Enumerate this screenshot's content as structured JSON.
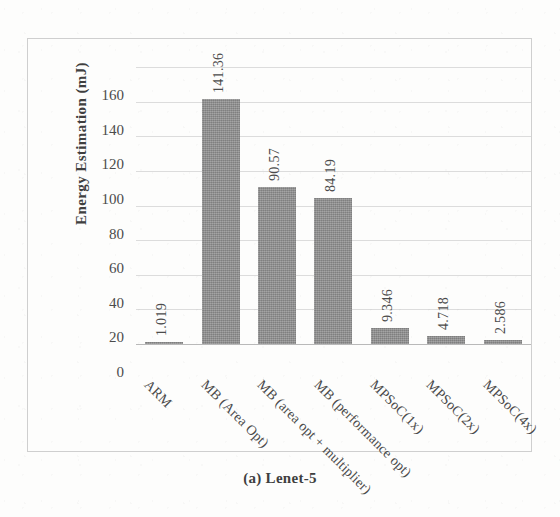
{
  "caption": "(a) Lenet-5",
  "colors": {
    "bar_fill": "#8b8b8b",
    "gridline": "#dcdcdc",
    "axis": "#b9b9b9",
    "text": "#4b4b4b",
    "page_background": "#fdfdfc"
  },
  "chart_data": {
    "type": "bar",
    "title": "(a) Lenet-5",
    "xlabel": "",
    "ylabel": "Energy Estimation (mJ)",
    "ylim": [
      0,
      160
    ],
    "ytick_step": 20,
    "yticks": [
      160,
      140,
      120,
      100,
      80,
      60,
      40,
      20,
      0
    ],
    "ytick_labels": [
      "160",
      "140",
      "120",
      "100",
      "80",
      "60",
      "40",
      "20",
      "0"
    ],
    "grid": true,
    "legend": false,
    "categories": [
      "ARM",
      "MB (Area Opt)",
      "MB (area opt + multiplier)",
      "MB (performance opt)",
      "MPSoC(1x)",
      "MPSoC(2x)",
      "MPSoC(4x)"
    ],
    "values": [
      1.019,
      141.36,
      90.57,
      84.19,
      9.346,
      4.718,
      2.586
    ],
    "data_labels": [
      "1.019",
      "141.36",
      "90.57",
      "84.19",
      "9.346",
      "4.718",
      "2.586"
    ],
    "bars": [
      {
        "category": "ARM",
        "value": 1.019,
        "label": "1.019"
      },
      {
        "category": "MB (Area Opt)",
        "value": 141.36,
        "label": "141.36"
      },
      {
        "category": "MB (area opt + multiplier)",
        "value": 90.57,
        "label": "90.57"
      },
      {
        "category": "MB (performance opt)",
        "value": 84.19,
        "label": "84.19"
      },
      {
        "category": "MPSoC(1x)",
        "value": 9.346,
        "label": "9.346"
      },
      {
        "category": "MPSoC(2x)",
        "value": 4.718,
        "label": "4.718"
      },
      {
        "category": "MPSoC(4x)",
        "value": 2.586,
        "label": "2.586"
      }
    ]
  }
}
